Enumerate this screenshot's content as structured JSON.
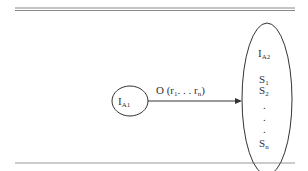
{
  "diagram": {
    "source_node": {
      "label": "I",
      "subscript": "A1"
    },
    "target_node": {
      "label": "I",
      "subscript": "A2",
      "items": [
        {
          "label": "S",
          "subscript": "1"
        },
        {
          "label": "S",
          "subscript": "2"
        },
        {
          "label": "S",
          "subscript": "n"
        }
      ],
      "ellipsis_dots": [
        ".",
        ".",
        "."
      ]
    },
    "edge": {
      "label_prefix": "O (r",
      "sub_first": "1",
      "middle": ". . . r",
      "sub_last": "n",
      "label_suffix": ")"
    }
  }
}
